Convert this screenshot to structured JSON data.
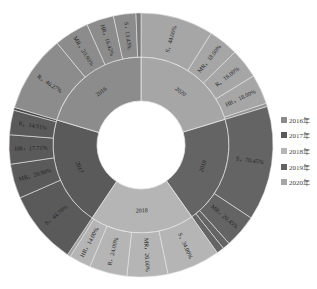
{
  "chart_data": {
    "type": "sunburst",
    "title": "",
    "legend_position": "right",
    "legend": [
      {
        "label": "2016年",
        "color": "#8c8c8c"
      },
      {
        "label": "2017年",
        "color": "#5a5a5a"
      },
      {
        "label": "2018年",
        "color": "#b5b5b5"
      },
      {
        "label": "2019年",
        "color": "#646464"
      },
      {
        "label": "2020年",
        "color": "#a6a6a6"
      }
    ],
    "inner": [
      {
        "name": "2020",
        "share": 20.3,
        "color": "#a6a6a6",
        "children": [
          {
            "name": "S",
            "value": 44.0,
            "label": "S，44.00%"
          },
          {
            "name": "MR",
            "value": 18.0,
            "label": "MR，18.00%"
          },
          {
            "name": "R",
            "value": 18.0,
            "label": "R，18.00%"
          },
          {
            "name": "HR",
            "value": 18.0,
            "label": "HR，18.00%"
          },
          {
            "name": "other",
            "value": 2.0,
            "label": ""
          }
        ]
      },
      {
        "name": "2019",
        "share": 19.9,
        "color": "#646464",
        "children": [
          {
            "name": "S",
            "value": 70.45,
            "label": "S，70.45%"
          },
          {
            "name": "MR",
            "value": 20.45,
            "label": "MR，20.45%"
          },
          {
            "name": "R",
            "value": 4.55,
            "label": ""
          },
          {
            "name": "HR",
            "value": 4.55,
            "label": ""
          }
        ]
      },
      {
        "name": "2018",
        "share": 19.2,
        "color": "#b5b5b5",
        "children": [
          {
            "name": "S",
            "value": 34.0,
            "label": "S，34.00%"
          },
          {
            "name": "MR",
            "value": 26.0,
            "label": "MR，26.00%"
          },
          {
            "name": "R",
            "value": 24.0,
            "label": "R，24.00%"
          },
          {
            "name": "HR",
            "value": 14.0,
            "label": "HR，14.00%"
          },
          {
            "name": "other",
            "value": 2.0,
            "label": ""
          }
        ]
      },
      {
        "name": "2017",
        "share": 20.2,
        "color": "#5a5a5a",
        "children": [
          {
            "name": "S",
            "value": 44.78,
            "label": "S，44.78%"
          },
          {
            "name": "MR",
            "value": 20.9,
            "label": "MR，20.90%"
          },
          {
            "name": "HR",
            "value": 17.71,
            "label": "HR，17.71%"
          },
          {
            "name": "R",
            "value": 14.91,
            "label": "R，14.91%"
          },
          {
            "name": "other",
            "value": 1.7,
            "label": ""
          }
        ]
      },
      {
        "name": "2016",
        "share": 20.4,
        "color": "#8c8c8c",
        "children": [
          {
            "name": "R",
            "value": 46.27,
            "label": "R，46.27%"
          },
          {
            "name": "MR",
            "value": 20.9,
            "label": "MR，20.90%"
          },
          {
            "name": "HR",
            "value": 16.42,
            "label": "HR，16.42%"
          },
          {
            "name": "S",
            "value": 13.43,
            "label": "S，13.43%"
          },
          {
            "name": "other",
            "value": 2.98,
            "label": ""
          }
        ]
      }
    ]
  }
}
